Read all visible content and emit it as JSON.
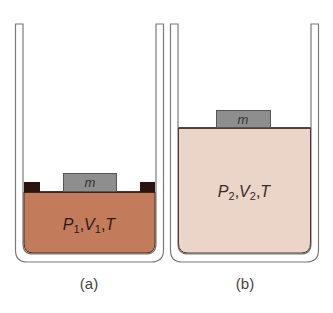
{
  "panels": [
    {
      "id": "a",
      "caption": "(a)",
      "mass_label": "m",
      "state": {
        "P": "P",
        "P_sub": "1",
        "sep1": ",",
        "V": "V",
        "V_sub": "1",
        "sep2": ",",
        "T": "T"
      },
      "gas_color": "#c27c5c",
      "has_stops": true
    },
    {
      "id": "b",
      "caption": "(b)",
      "mass_label": "m",
      "state": {
        "P": "P",
        "P_sub": "2",
        "sep1": ",",
        "V": "V",
        "V_sub": "2",
        "sep2": ",",
        "T": "T"
      },
      "gas_color": "#ead5c8",
      "has_stops": false
    }
  ],
  "colors": {
    "cylinder_wall": "#7a7a7a",
    "mass_fill": "#8e8e8e",
    "stop_fill": "#2a1410",
    "piston_line": "#3a2a24"
  }
}
